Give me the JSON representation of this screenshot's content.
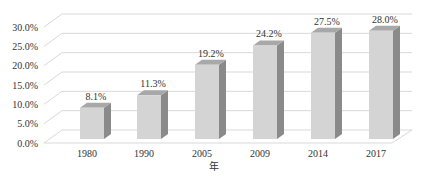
{
  "chart_data": {
    "type": "bar",
    "style": "3d-column",
    "title": "",
    "xlabel": "年",
    "ylabel": "",
    "categories": [
      "1980",
      "1990",
      "2005",
      "2009",
      "2014",
      "2017"
    ],
    "values": [
      8.1,
      11.3,
      19.2,
      24.2,
      27.5,
      28.0
    ],
    "data_labels": [
      "8.1%",
      "11.3%",
      "19.2%",
      "24.2%",
      "27.5%",
      "28.0%"
    ],
    "y_ticks": [
      "0.0%",
      "5.0%",
      "10.0%",
      "15.0%",
      "20.0%",
      "25.0%",
      "30.0%"
    ],
    "ylim": [
      0,
      30
    ],
    "grid": true,
    "legend": "none",
    "colors": {
      "bar_front": "#d4d4d4",
      "bar_side": "#8a8a8a",
      "bar_top": "#a8a8a8",
      "grid": "#d9d9d9",
      "text": "#333333"
    }
  }
}
